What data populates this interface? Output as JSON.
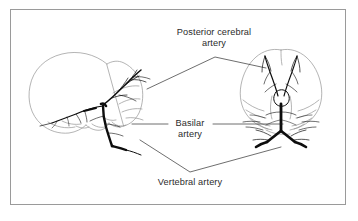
{
  "figure": {
    "type": "medical-illustration",
    "background_color": "#ffffff",
    "frame_color": "#9a9a9a",
    "ink_color": "#000000",
    "outline_color": "#8d8d8d",
    "text_color": "#2b2b2b"
  },
  "views": {
    "left": {
      "name": "lateral-view",
      "description": "Lateral projection of skull and brain with posterior circulation vessels"
    },
    "right": {
      "name": "anteroposterior-view",
      "description": "Anteroposterior projection of brain with basilar and vertebral arteries"
    }
  },
  "labels": [
    {
      "id": "posterior-cerebral-artery",
      "line1": "Posterior cerebral",
      "line2": "artery",
      "leader": "inverted-v"
    },
    {
      "id": "basilar-artery",
      "line1": "Basilar",
      "line2": "artery",
      "leader": "horizontal-both-sides"
    },
    {
      "id": "vertebral-artery",
      "line1": "Vertebral artery",
      "line2": "",
      "leader": "v-shape"
    }
  ]
}
